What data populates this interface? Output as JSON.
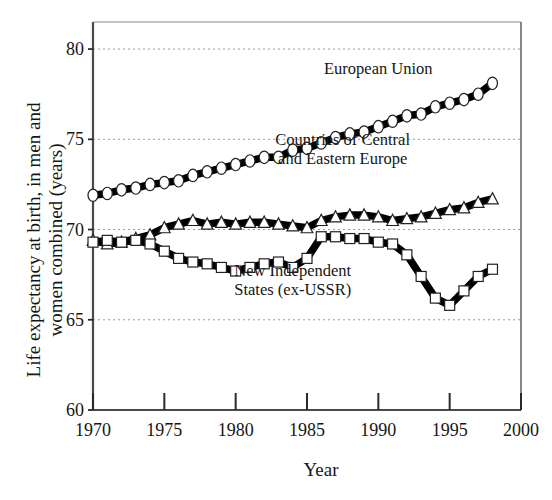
{
  "chart_data": {
    "type": "line",
    "title": "",
    "xlabel": "Year",
    "ylabel": "Life expectancy at birth, in men and women combined (years)",
    "xlim": [
      1970,
      2000
    ],
    "ylim": [
      60,
      81.5
    ],
    "grid": true,
    "grid_values": [
      65,
      70,
      75,
      80
    ],
    "legend_position": "inline-annotations",
    "xticks": [
      1970,
      1975,
      1980,
      1985,
      1990,
      1995,
      2000
    ],
    "xtick_labels": [
      "1970",
      "1975",
      "1980",
      "1985",
      "1990",
      "1995",
      "2000"
    ],
    "yticks": [
      60,
      65,
      70,
      75,
      80
    ],
    "ytick_labels": [
      "60",
      "65",
      "70",
      "75",
      "80"
    ],
    "series": [
      {
        "name": "European Union",
        "marker": "circle",
        "label_x": 1990.0,
        "label_y": 78.6,
        "x": [
          1970,
          1971,
          1972,
          1973,
          1974,
          1975,
          1976,
          1977,
          1978,
          1979,
          1980,
          1981,
          1982,
          1983,
          1984,
          1985,
          1986,
          1987,
          1988,
          1989,
          1990,
          1991,
          1992,
          1993,
          1994,
          1995,
          1996,
          1997,
          1998
        ],
        "values": [
          71.9,
          72.0,
          72.2,
          72.3,
          72.5,
          72.6,
          72.7,
          73.0,
          73.2,
          73.4,
          73.6,
          73.8,
          74.0,
          74.0,
          74.4,
          74.5,
          74.8,
          75.1,
          75.3,
          75.4,
          75.7,
          76.0,
          76.3,
          76.4,
          76.8,
          77.0,
          77.2,
          77.5,
          78.1
        ]
      },
      {
        "name": "Countries  of Central\nand Eastern Europe",
        "label_line1": "Countries  of Central",
        "label_line2": "and Eastern Europe",
        "marker": "triangle",
        "label_x": 1987.5,
        "label_y": 74.7,
        "x": [
          1970,
          1971,
          1972,
          1973,
          1974,
          1975,
          1976,
          1977,
          1978,
          1979,
          1980,
          1981,
          1982,
          1983,
          1984,
          1985,
          1986,
          1987,
          1988,
          1989,
          1990,
          1991,
          1992,
          1993,
          1994,
          1995,
          1996,
          1997,
          1998
        ],
        "values": [
          69.4,
          69.2,
          69.3,
          69.5,
          69.7,
          70.1,
          70.3,
          70.5,
          70.3,
          70.4,
          70.3,
          70.4,
          70.4,
          70.3,
          70.2,
          70.1,
          70.5,
          70.7,
          70.8,
          70.8,
          70.7,
          70.5,
          70.6,
          70.7,
          70.9,
          71.1,
          71.2,
          71.5,
          71.7
        ]
      },
      {
        "name": "New Independent\nStates (ex-USSR)",
        "label_line1": "New Independent",
        "label_line2": "States (ex-USSR)",
        "marker": "square",
        "label_x": 1984.0,
        "label_y": 67.4,
        "x": [
          1970,
          1971,
          1972,
          1973,
          1974,
          1975,
          1976,
          1977,
          1978,
          1979,
          1980,
          1981,
          1982,
          1983,
          1984,
          1985,
          1986,
          1987,
          1988,
          1989,
          1990,
          1991,
          1992,
          1993,
          1994,
          1995,
          1996,
          1997,
          1998
        ],
        "values": [
          69.3,
          69.4,
          69.3,
          69.4,
          69.2,
          68.8,
          68.4,
          68.2,
          68.1,
          67.9,
          67.7,
          67.9,
          68.1,
          68.2,
          67.9,
          68.4,
          69.6,
          69.6,
          69.5,
          69.5,
          69.3,
          69.2,
          68.6,
          67.4,
          66.2,
          65.8,
          66.6,
          67.4,
          67.8
        ]
      }
    ]
  },
  "axis": {
    "y_title": "Life expectancy at birth, in men and women combined (years)",
    "x_title": "Year"
  }
}
